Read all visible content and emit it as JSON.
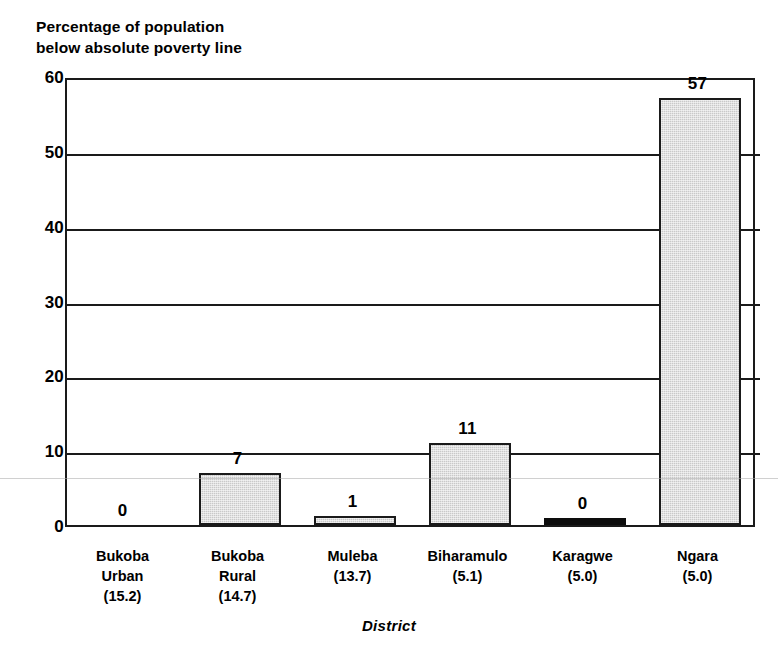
{
  "chart_data": {
    "type": "bar",
    "title": "Percentage of population\nbelow absolute poverty line",
    "title_line1": "Percentage of population",
    "title_line2": "below absolute poverty line",
    "xlabel": "District",
    "ylabel": "",
    "ylim": [
      0,
      60
    ],
    "yticks": [
      0,
      10,
      20,
      30,
      40,
      50,
      60
    ],
    "ytick_labels": [
      "0",
      "10",
      "20",
      "30",
      "40",
      "50",
      "60"
    ],
    "grid": true,
    "legend": "none",
    "categories": [
      "Bukoba Urban (15.2)",
      "Bukoba Rural (14.7)",
      "Muleba (13.7)",
      "Biharamulo (5.1)",
      "Karagwe (5.0)",
      "Ngara (5.0)"
    ],
    "category_lines": [
      [
        "Bukoba",
        "Urban",
        "(15.2)"
      ],
      [
        "Bukoba",
        "Rural",
        "(14.7)"
      ],
      [
        "Muleba",
        "(13.7)"
      ],
      [
        "Biharamulo",
        "(5.1)"
      ],
      [
        "Karagwe",
        "(5.0)"
      ],
      [
        "Ngara",
        "(5.0)"
      ]
    ],
    "values": [
      0,
      7,
      1,
      11,
      0,
      57
    ],
    "data_labels": [
      "0",
      "7",
      "1",
      "11",
      "0",
      "57"
    ],
    "bar_styles": [
      "none",
      "gray",
      "gray",
      "gray",
      "solid-black",
      "gray"
    ],
    "colors": {
      "bar_fill": "#c9c9c9",
      "bar_edge": "#1a1a1a",
      "solid_bar": "#0d0d0d",
      "axis": "#1a1a1a",
      "text": "#000000",
      "background": "#ffffff"
    }
  }
}
